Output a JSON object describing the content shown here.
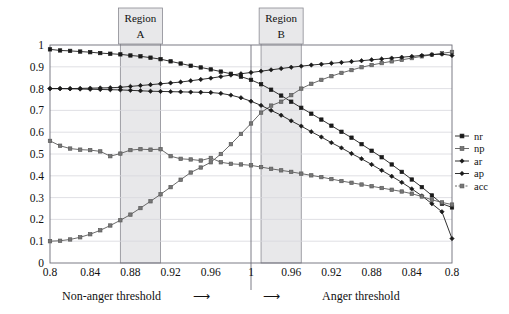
{
  "chart_data": {
    "type": "line",
    "title": "",
    "xlabel": "",
    "ylabel": "",
    "ylim": [
      0,
      1
    ],
    "grid": true,
    "legend_position": "right",
    "left_axis_label": "Non-anger threshold",
    "right_axis_label": "Anger threshold",
    "left_arrow": "⟶",
    "right_arrow": "⟶",
    "y_ticks": [
      "0",
      "0.1",
      "0.2",
      "0.3",
      "0.4",
      "0.5",
      "0.6",
      "0.7",
      "0.8",
      "0.9",
      "1"
    ],
    "y_tick_values": [
      0,
      0.1,
      0.2,
      0.3,
      0.4,
      0.5,
      0.6,
      0.7,
      0.8,
      0.9,
      1
    ],
    "x_ticks": [
      "0.8",
      "0.84",
      "0.88",
      "0.92",
      "0.96",
      "1",
      "0.96",
      "0.92",
      "0.88",
      "0.84",
      "0.8"
    ],
    "x_tick_index": [
      0,
      4,
      8,
      12,
      16,
      20,
      24,
      28,
      32,
      36,
      40
    ],
    "n_points": 41,
    "regions": [
      {
        "name": "Region",
        "letter": "A",
        "start_index": 7,
        "end_index": 11
      },
      {
        "name": "Region",
        "letter": "B",
        "start_index": 21,
        "end_index": 25
      }
    ],
    "series": [
      {
        "name": "nr",
        "color": "#1a1a1a",
        "marker": "square",
        "values": [
          0.98,
          0.975,
          0.973,
          0.97,
          0.967,
          0.963,
          0.96,
          0.957,
          0.952,
          0.948,
          0.942,
          0.935,
          0.925,
          0.915,
          0.905,
          0.897,
          0.888,
          0.878,
          0.868,
          0.855,
          0.84,
          0.82,
          0.795,
          0.768,
          0.74,
          0.712,
          0.685,
          0.658,
          0.63,
          0.602,
          0.575,
          0.545,
          0.515,
          0.485,
          0.452,
          0.418,
          0.383,
          0.348,
          0.31,
          0.272,
          0.255
        ]
      },
      {
        "name": "np",
        "color": "#5a5a5a",
        "marker": "square",
        "values": [
          0.1,
          0.102,
          0.108,
          0.118,
          0.132,
          0.15,
          0.172,
          0.196,
          0.222,
          0.252,
          0.283,
          0.315,
          0.348,
          0.382,
          0.415,
          0.438,
          0.462,
          0.5,
          0.545,
          0.592,
          0.64,
          0.69,
          0.722,
          0.74,
          0.77,
          0.8,
          0.822,
          0.84,
          0.857,
          0.872,
          0.885,
          0.898,
          0.908,
          0.917,
          0.925,
          0.932,
          0.94,
          0.948,
          0.955,
          0.962,
          0.968
        ]
      },
      {
        "name": "ar",
        "color": "#1a1a1a",
        "marker": "diamond",
        "values": [
          0.8,
          0.8,
          0.8,
          0.801,
          0.802,
          0.803,
          0.804,
          0.806,
          0.81,
          0.814,
          0.818,
          0.822,
          0.826,
          0.83,
          0.836,
          0.842,
          0.848,
          0.855,
          0.862,
          0.868,
          0.874,
          0.88,
          0.886,
          0.892,
          0.898,
          0.903,
          0.908,
          0.912,
          0.916,
          0.92,
          0.924,
          0.928,
          0.932,
          0.936,
          0.94,
          0.944,
          0.948,
          0.952,
          0.956,
          0.958,
          0.952
        ]
      },
      {
        "name": "ap",
        "color": "#1a1a1a",
        "marker": "diamond",
        "values": [
          0.8,
          0.8,
          0.799,
          0.798,
          0.797,
          0.796,
          0.795,
          0.794,
          0.792,
          0.79,
          0.788,
          0.787,
          0.786,
          0.785,
          0.784,
          0.783,
          0.782,
          0.778,
          0.77,
          0.758,
          0.742,
          0.723,
          0.7,
          0.678,
          0.652,
          0.628,
          0.602,
          0.578,
          0.552,
          0.528,
          0.502,
          0.478,
          0.452,
          0.425,
          0.398,
          0.37,
          0.34,
          0.308,
          0.272,
          0.235,
          0.112
        ]
      },
      {
        "name": "acc",
        "color": "#5a5a5a",
        "marker": "square",
        "values": [
          0.56,
          0.538,
          0.525,
          0.52,
          0.518,
          0.512,
          0.49,
          0.502,
          0.518,
          0.522,
          0.52,
          0.522,
          0.49,
          0.478,
          0.475,
          0.47,
          0.482,
          0.462,
          0.455,
          0.452,
          0.448,
          0.44,
          0.432,
          0.425,
          0.418,
          0.41,
          0.402,
          0.394,
          0.385,
          0.376,
          0.368,
          0.36,
          0.352,
          0.344,
          0.336,
          0.328,
          0.318,
          0.305,
          0.29,
          0.278,
          0.268
        ]
      }
    ]
  },
  "legend": {
    "items": [
      {
        "label": "nr"
      },
      {
        "label": "np"
      },
      {
        "label": "ar"
      },
      {
        "label": "ap"
      },
      {
        "label": "acc"
      }
    ]
  }
}
